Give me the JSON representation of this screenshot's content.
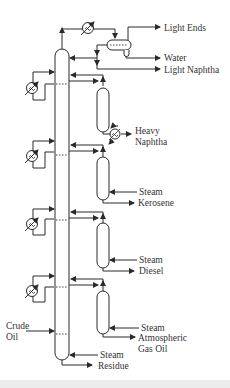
{
  "diagram": {
    "labels": {
      "light_ends": "Light Ends",
      "water": "Water",
      "light_naphtha": "Light Naphtha",
      "heavy_naphtha_1": "Heavy",
      "heavy_naphtha_2": "Naphtha",
      "steam_kerosene": "Steam",
      "kerosene": "Kerosene",
      "steam_diesel": "Steam",
      "diesel": "Diesel",
      "steam_ago": "Steam",
      "ago_1": "Atmospheric",
      "ago_2": "Gas Oil",
      "crude_1": "Crude",
      "crude_2": "Oil",
      "steam_residue": "Steam",
      "residue": "Residue"
    },
    "equipment": {
      "main_column": "Atmospheric distillation column",
      "overhead_condenser": "Overhead condenser",
      "reflux_drum": "Reflux drum",
      "strippers": [
        "Heavy naphtha stripper",
        "Kerosene stripper",
        "Diesel stripper",
        "AGO stripper"
      ],
      "pumparound_exchangers": 4,
      "heavy_naphtha_cooler": "Heavy naphtha exchanger"
    },
    "colors": {
      "line": "#2a2a2a",
      "background": "#ffffff"
    }
  }
}
